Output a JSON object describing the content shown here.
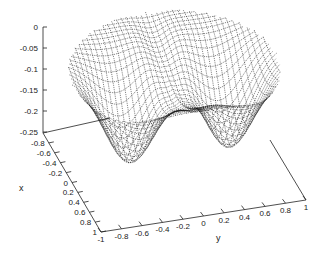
{
  "chart_data": {
    "type": "surface3d",
    "title": "",
    "xlabel": "x",
    "ylabel": "y",
    "zlabel": "",
    "x_ticks": [
      "-0.8",
      "-0.6",
      "-0.4",
      "-0.2",
      "0",
      "0.2",
      "0.4",
      "0.6",
      "0.8",
      "1"
    ],
    "y_ticks": [
      "-1",
      "-0.8",
      "-0.6",
      "-0.4",
      "-0.2",
      "0",
      "0.2",
      "0.4",
      "0.6",
      "0.8",
      "1"
    ],
    "z_ticks": [
      "0",
      "-0.05",
      "-0.1",
      "-0.15",
      "-0.2",
      "-0.25"
    ],
    "xlim": [
      -1,
      1
    ],
    "ylim": [
      -1,
      1
    ],
    "zlim": [
      -0.25,
      0
    ],
    "grid": false,
    "legend": null,
    "features": [
      {
        "name": "rim",
        "z": 0
      },
      {
        "name": "left-well",
        "approx_center": [
          0.2,
          -0.5
        ],
        "z_min": -0.22
      },
      {
        "name": "right-well",
        "approx_center": [
          0.2,
          0.5
        ],
        "z_min": -0.22
      },
      {
        "name": "central-ridge",
        "along": "y=0",
        "z": -0.08
      }
    ]
  }
}
